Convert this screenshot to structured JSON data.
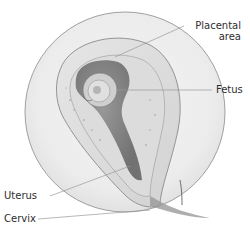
{
  "diagram": {
    "labels": [
      {
        "id": "placental-area",
        "line1": "Placental",
        "line2": "area"
      },
      {
        "id": "fetus",
        "text": "Fetus"
      },
      {
        "id": "uterus",
        "text": "Uterus"
      },
      {
        "id": "cervix",
        "text": "Cervix"
      }
    ],
    "colors": {
      "background": "#ffffff",
      "outline": "#8a8a8a",
      "leader_line": "#9a9a9a",
      "tissue_light": "#ececec",
      "tissue_mid": "#cfcfcf",
      "cavity_dark": "#6e6e6e",
      "text": "#2e2e2e"
    }
  }
}
